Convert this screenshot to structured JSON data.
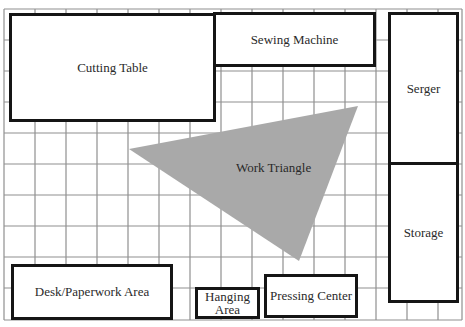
{
  "diagram": {
    "type": "sewing-room-floor-plan",
    "grid": {
      "cell_size_px": 31,
      "columns": 15,
      "rows": 10,
      "line_color": "#8f8f8f"
    },
    "colors": {
      "zone_border": "#151515",
      "zone_fill": "#ffffff",
      "triangle_fill": "#a9a9a9",
      "text": "#2a2a2a"
    },
    "zones": {
      "cutting_table": {
        "label": "Cutting Table"
      },
      "sewing_machine": {
        "label": "Sewing Machine"
      },
      "serger": {
        "label": "Serger"
      },
      "storage": {
        "label": "Storage"
      },
      "desk": {
        "label": "Desk/Paperwork Area"
      },
      "hanging": {
        "label_line1": "Hanging",
        "label_line2": "Area"
      },
      "pressing": {
        "label": "Pressing Center"
      }
    },
    "work_triangle": {
      "label": "Work Triangle",
      "vertices": [
        [
          129,
          149
        ],
        [
          358,
          106
        ],
        [
          299,
          261
        ]
      ]
    }
  }
}
